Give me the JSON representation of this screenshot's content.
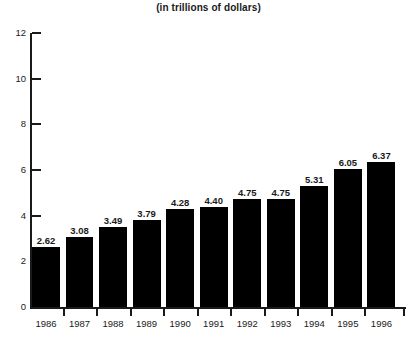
{
  "chart_data": {
    "type": "bar",
    "title": "(in trillions of dollars)",
    "subtitle": "",
    "xlabel": "",
    "ylabel": "",
    "categories": [
      "1986",
      "1987",
      "1988",
      "1989",
      "1990",
      "1991",
      "1992",
      "1993",
      "1994",
      "1995",
      "1996"
    ],
    "values": [
      2.62,
      3.08,
      3.49,
      3.79,
      4.28,
      4.4,
      4.75,
      4.75,
      5.31,
      6.05,
      6.37
    ],
    "value_labels": [
      "2.62",
      "3.08",
      "3.49",
      "3.79",
      "4.28",
      "4.40",
      "4.75",
      "4.75",
      "5.31",
      "6.05",
      "6.37"
    ],
    "ylim": [
      0,
      12
    ],
    "y_ticks": [
      0,
      2,
      4,
      6,
      8,
      10,
      12
    ],
    "y_tick_labels": [
      "0",
      "2",
      "4",
      "6",
      "8",
      "10",
      "12"
    ],
    "grid": false,
    "legend": false,
    "legend_position": "none",
    "bar_color": "#000000",
    "axis_color": "#1a1a1a",
    "background_color": "#ffffff",
    "data_labels_shown": true
  }
}
